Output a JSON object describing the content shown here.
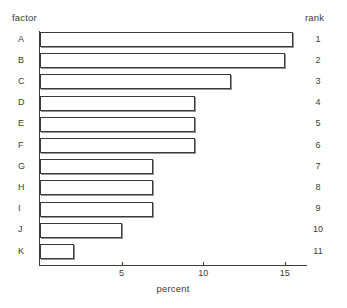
{
  "headers": {
    "factor": "factor",
    "rank": "rank"
  },
  "chart_data": {
    "type": "bar",
    "orientation": "horizontal",
    "title": "",
    "xlabel": "percent",
    "ylabel": "factor",
    "categories": [
      "A",
      "B",
      "C",
      "D",
      "E",
      "F",
      "G",
      "H",
      "I",
      "J",
      "K"
    ],
    "values": [
      15.5,
      15.0,
      11.7,
      9.5,
      9.5,
      9.5,
      6.9,
      6.9,
      6.9,
      5.0,
      2.1
    ],
    "ranks": [
      1,
      2,
      3,
      4,
      5,
      6,
      7,
      8,
      9,
      10,
      11
    ],
    "xlim": [
      0,
      16.3
    ],
    "xticks": [
      5,
      10,
      15
    ],
    "xtick_labels": [
      "5",
      "10",
      "15"
    ],
    "grid": false,
    "legend": false,
    "bar_fill": "#ffffff",
    "bar_edge": "#3a3a3a"
  }
}
